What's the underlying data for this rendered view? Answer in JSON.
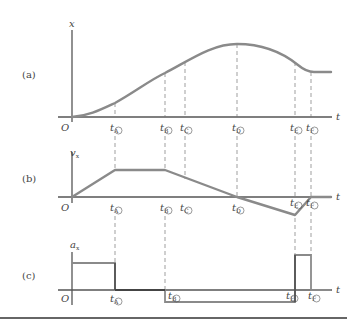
{
  "figure": {
    "panels": [
      {
        "id": "a",
        "label": "(a)",
        "y_axis_label": "x",
        "x_axis_label": "t",
        "origin_label": "O",
        "description": "position vs time: rises from origin, max at tD, decreases to constant after tF"
      },
      {
        "id": "b",
        "label": "(b)",
        "y_axis_label": "v",
        "y_axis_sub": "x",
        "x_axis_label": "t",
        "origin_label": "O",
        "description": "velocity vs time: linear rise to tA, constant to tB, linear decrease through zero at tD to minimum at tE, linear rise to zero at tF"
      },
      {
        "id": "c",
        "label": "(c)",
        "y_axis_label": "a",
        "y_axis_sub": "x",
        "x_axis_label": "t",
        "origin_label": "O",
        "description": "acceleration vs time: positive constant to tA, zero to tB, negative constant to tE, positive spike to tF, zero after"
      }
    ],
    "time_marks": [
      {
        "key": "A",
        "t": "t",
        "sub": "A",
        "x": 115
      },
      {
        "key": "B",
        "t": "t",
        "sub": "B",
        "x": 165
      },
      {
        "key": "C",
        "t": "t",
        "sub": "C",
        "x": 185
      },
      {
        "key": "D",
        "t": "t",
        "sub": "D",
        "x": 237
      },
      {
        "key": "E",
        "t": "t",
        "sub": "E",
        "x": 295
      },
      {
        "key": "F",
        "t": "t",
        "sub": "F",
        "x": 311
      }
    ],
    "panel_a_marks": [
      "A",
      "B",
      "C",
      "D",
      "E",
      "F"
    ],
    "panel_b_marks": [
      "A",
      "B",
      "C",
      "D",
      "E",
      "F"
    ],
    "panel_c_marks": [
      "A",
      "B",
      "E",
      "F"
    ]
  }
}
